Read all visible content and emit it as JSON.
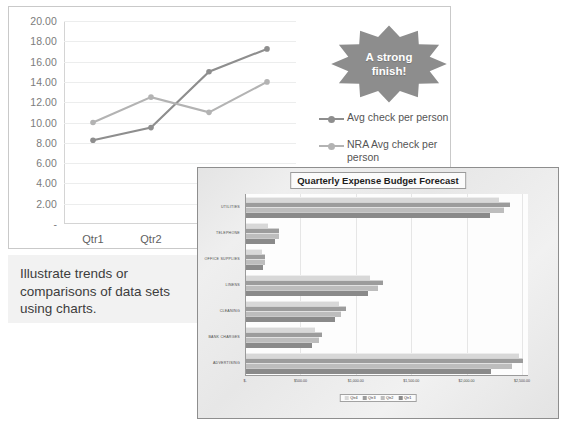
{
  "slide": {
    "caption": "Illustrate trends or comparisons of data sets using charts.",
    "callout_text_line1": "A strong",
    "callout_text_line2": "finish!",
    "callout_color": "#8d8d8d"
  },
  "chart_data": [
    {
      "type": "line",
      "title": "",
      "xlabel": "",
      "ylabel": "",
      "categories": [
        "Qtr1",
        "Qtr2",
        "Qtr3",
        "Qtr4"
      ],
      "ylim": [
        0,
        20
      ],
      "ytick_labels": [
        "-",
        "2.00",
        "4.00",
        "6.00",
        "8.00",
        "10.00",
        "12.00",
        "14.00",
        "16.00",
        "18.00",
        "20.00"
      ],
      "ytick_values": [
        0,
        2,
        4,
        6,
        8,
        10,
        12,
        14,
        16,
        18,
        20
      ],
      "grid": true,
      "legend_position": "right",
      "series": [
        {
          "name": "Avg check per person",
          "values": [
            8.25,
            9.5,
            15.0,
            17.25
          ],
          "color": "#8e8e8e"
        },
        {
          "name": "NRA Avg check per person",
          "values": [
            10.0,
            12.5,
            11.0,
            14.0
          ],
          "color": "#b3b3b3"
        }
      ]
    },
    {
      "type": "bar",
      "orientation": "horizontal",
      "title": "Quarterly Expense Budget Forecast",
      "xlabel": "",
      "ylabel": "",
      "categories": [
        "UTILITIES",
        "TELEPHONE",
        "OFFICE SUPPLIES",
        "LINENS",
        "CLEANING",
        "BANK CHARGES",
        "ADVERTISING"
      ],
      "xlim": [
        0,
        2500
      ],
      "xtick_labels": [
        "$-",
        "$500.00",
        "$1,000.00",
        "$1,500.00",
        "$2,000.00",
        "$2,500.00"
      ],
      "xtick_values": [
        0,
        500,
        1000,
        1500,
        2000,
        2500
      ],
      "grid": true,
      "legend_position": "bottom",
      "legend_order": [
        "Qtr4",
        "Qtr3",
        "Qtr2",
        "Qtr1"
      ],
      "series": [
        {
          "name": "Qtr4",
          "color": "#d8d8d8",
          "values": [
            2280,
            200,
            140,
            1120,
            840,
            620,
            2460
          ]
        },
        {
          "name": "Qtr3",
          "color": "#9c9c9c",
          "values": [
            2380,
            300,
            175,
            1240,
            900,
            690,
            2500
          ]
        },
        {
          "name": "Qtr2",
          "color": "#bdbdbd",
          "values": [
            2330,
            300,
            175,
            1190,
            860,
            655,
            2400
          ]
        },
        {
          "name": "Qtr1",
          "color": "#8a8a8a",
          "values": [
            2200,
            260,
            150,
            1100,
            800,
            600,
            2210
          ]
        }
      ]
    }
  ]
}
